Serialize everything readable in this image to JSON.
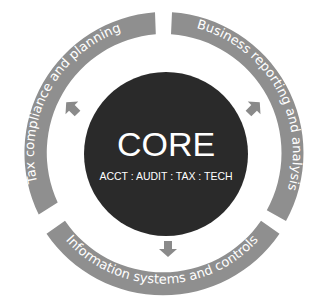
{
  "diagram": {
    "core": {
      "title": "CORE",
      "subtitle": "ACCT : AUDIT : TAX : TECH"
    },
    "segments": [
      {
        "id": "tax",
        "label": "Tax compliance and planning"
      },
      {
        "id": "business",
        "label": "Business reporting and analysis"
      },
      {
        "id": "info",
        "label": "Information systems and controls"
      }
    ],
    "arrows": [
      {
        "id": "arrow-to-tax",
        "direction": "up-left"
      },
      {
        "id": "arrow-to-business",
        "direction": "up-right"
      },
      {
        "id": "arrow-to-info",
        "direction": "down"
      }
    ],
    "colors": {
      "ring": "#8f8f8f",
      "core": "#2a2a2a",
      "arrow": "#8a8a8a",
      "text": "#ffffff"
    }
  }
}
